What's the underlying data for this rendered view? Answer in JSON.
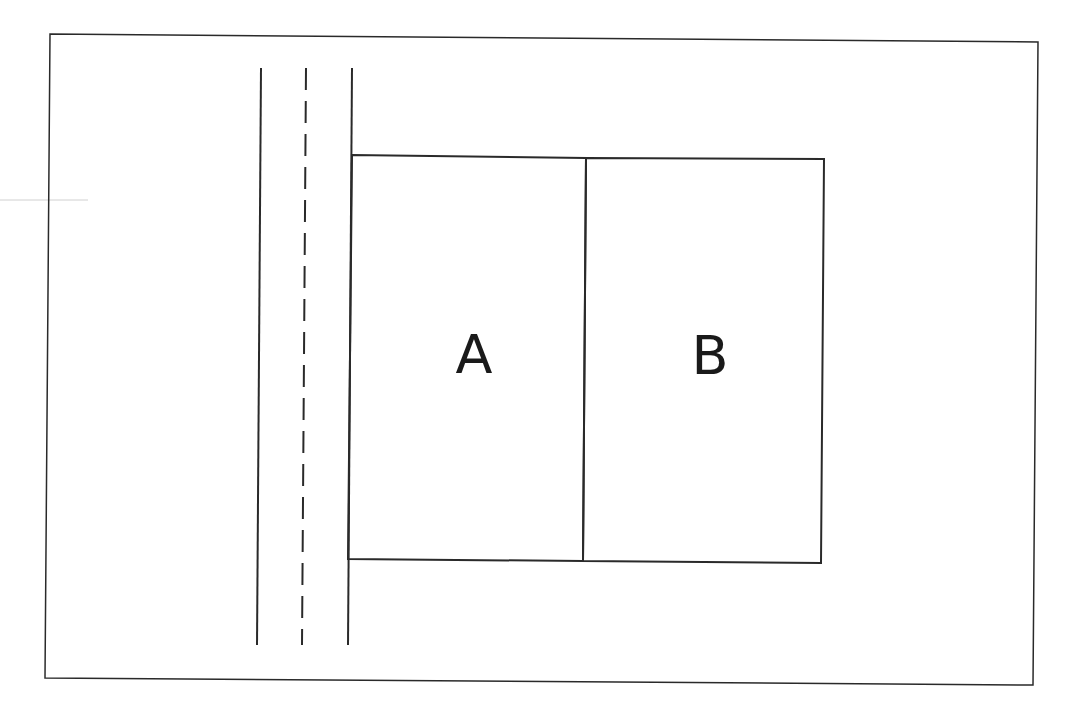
{
  "diagram": {
    "type": "site-plan",
    "colors": {
      "background": "#ffffff",
      "line": "#2a2a2a",
      "artifact": "#d0d0d0"
    },
    "frame": {
      "points": [
        [
          50,
          34
        ],
        [
          1038,
          42
        ],
        [
          1033,
          685
        ],
        [
          45,
          678
        ]
      ]
    },
    "road": {
      "left_edge": {
        "from": [
          261,
          68
        ],
        "to": [
          257,
          645
        ]
      },
      "center_line": {
        "from": [
          306,
          68
        ],
        "to": [
          302,
          645
        ],
        "style": "dashed",
        "dash": "22 11"
      },
      "right_edge": {
        "from": [
          352,
          68
        ],
        "to": [
          348,
          645
        ]
      }
    },
    "lots": [
      {
        "id": "A",
        "label": "A",
        "label_pos": [
          474,
          355
        ],
        "points": [
          [
            352,
            155
          ],
          [
            586,
            158
          ],
          [
            583,
            561
          ],
          [
            348,
            559
          ]
        ]
      },
      {
        "id": "B",
        "label": "B",
        "label_pos": [
          710,
          356
        ],
        "points": [
          [
            586,
            158
          ],
          [
            824,
            159
          ],
          [
            821,
            563
          ],
          [
            583,
            561
          ]
        ]
      }
    ]
  }
}
